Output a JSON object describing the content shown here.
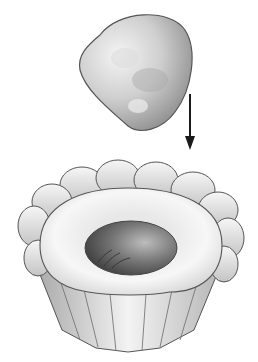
{
  "illustration": {
    "subject": "dough ball being placed into fluted tart mold",
    "elements": {
      "dough_ball": "dough-ball",
      "arrow": "down-arrow",
      "tart_mold": "fluted-tart-mold",
      "dough_lining": "pressed-dough-lining",
      "well": "center-well"
    },
    "colors": {
      "background": "#ffffff",
      "outline": "#4a4a4a",
      "light": "#f2f2f2",
      "mid": "#c8c8c8",
      "dark": "#5a5a5a",
      "arrow": "#1a1a1a"
    }
  }
}
